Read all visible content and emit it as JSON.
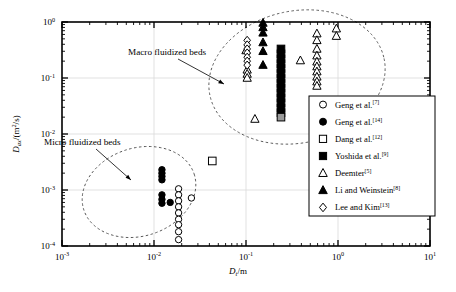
{
  "figure": {
    "background": "#ffffff",
    "frame_color": "#000000",
    "grid_color": "#d9d9d9",
    "guide_color": "#555555"
  },
  "axes": {
    "x": {
      "title_symbol": "D",
      "title_sub": "t",
      "title_unit": "/m",
      "ticks": [
        {
          "value": -3,
          "mantissa": "10",
          "exponent": "-3"
        },
        {
          "value": -2,
          "mantissa": "10",
          "exponent": "-2"
        },
        {
          "value": -1,
          "mantissa": "10",
          "exponent": "-1"
        },
        {
          "value": 0,
          "mantissa": "10",
          "exponent": "0"
        },
        {
          "value": 1,
          "mantissa": "10",
          "exponent": "1"
        }
      ],
      "min": -3,
      "max": 1,
      "scale": "log"
    },
    "y": {
      "title_symbol": "D",
      "title_sub": "ax",
      "title_unit": "/(m2/s)",
      "ticks": [
        {
          "value": -4,
          "mantissa": "10",
          "exponent": "-4"
        },
        {
          "value": -3,
          "mantissa": "10",
          "exponent": "-3"
        },
        {
          "value": -2,
          "mantissa": "10",
          "exponent": "-2"
        },
        {
          "value": -1,
          "mantissa": "10",
          "exponent": "-1"
        },
        {
          "value": 0,
          "mantissa": "10",
          "exponent": "0"
        }
      ],
      "min": -4,
      "max": 0,
      "scale": "log"
    }
  },
  "annotations": [
    {
      "id": "macro-label",
      "text": "Macro fluidized beds",
      "x": 128,
      "y": 55,
      "leader_from": [
        178,
        59
      ],
      "leader_to": [
        224,
        84
      ]
    },
    {
      "id": "micro-label",
      "text": "Micro fluidized beds",
      "x": 44,
      "y": 145,
      "leader_from": [
        96,
        149
      ],
      "leader_to": [
        131,
        180
      ]
    }
  ],
  "legend": {
    "box": {
      "x": 309,
      "y": 96,
      "width": 126,
      "height": 120
    },
    "entries": [
      {
        "marker": "open-circle",
        "label": "Geng et al.",
        "ref": "[7]"
      },
      {
        "marker": "filled-circle",
        "label": "Geng et al.",
        "ref": "[14]"
      },
      {
        "marker": "open-square",
        "label": "Dang et al.",
        "ref": "[12]"
      },
      {
        "marker": "filled-square",
        "label": "Yoshida et al.",
        "ref": "[9]"
      },
      {
        "marker": "open-triangle",
        "label": "Deemter",
        "ref": "[5]"
      },
      {
        "marker": "filled-triangle",
        "label": "Li and Weinstein",
        "ref": "[8]"
      },
      {
        "marker": "open-diamond",
        "label": "Lee and Kim",
        "ref": "[13]"
      }
    ]
  },
  "chart_data": {
    "type": "scatter",
    "title": "",
    "xlabel": "Dt/m",
    "ylabel": "Dax/(m2/s)",
    "xscale": "log",
    "yscale": "log",
    "xlim": [
      0.001,
      10
    ],
    "ylim": [
      0.0001,
      1
    ],
    "grid": true,
    "groups": [
      {
        "name": "Micro fluidized beds",
        "region": "ellipse",
        "center_x": 0.016,
        "center_y": 0.0012
      },
      {
        "name": "Macro fluidized beds",
        "region": "ellipse",
        "center_x": 0.35,
        "center_y": 0.18
      }
    ],
    "series": [
      {
        "name": "Geng et al.[7]",
        "marker": "open-circle",
        "points": [
          [
            0.0185,
            0.00105
          ],
          [
            0.0185,
            0.00082
          ],
          [
            0.0185,
            0.00064
          ],
          [
            0.0185,
            0.0005
          ],
          [
            0.0185,
            0.00039
          ],
          [
            0.0185,
            0.0003
          ],
          [
            0.0185,
            0.00024
          ],
          [
            0.0185,
            0.00018
          ],
          [
            0.0185,
            0.00013
          ],
          [
            0.0255,
            0.00072
          ]
        ]
      },
      {
        "name": "Geng et al.[14]",
        "marker": "filled-circle",
        "points": [
          [
            0.0122,
            0.0023
          ],
          [
            0.0122,
            0.002
          ],
          [
            0.0122,
            0.00175
          ],
          [
            0.0122,
            0.00152
          ],
          [
            0.0122,
            0.00082
          ],
          [
            0.0122,
            0.00068
          ],
          [
            0.0122,
            0.00058
          ],
          [
            0.015,
            0.0006
          ]
        ]
      },
      {
        "name": "Dang et al.[12]",
        "marker": "open-square",
        "points": [
          [
            0.043,
            0.0033
          ]
        ]
      },
      {
        "name": "Yoshida et al.[9]",
        "marker": "filled-square",
        "points": [
          [
            0.24,
            0.33
          ],
          [
            0.24,
            0.27
          ],
          [
            0.24,
            0.22
          ],
          [
            0.24,
            0.18
          ],
          [
            0.24,
            0.148
          ],
          [
            0.24,
            0.12
          ],
          [
            0.24,
            0.098
          ],
          [
            0.24,
            0.08
          ],
          [
            0.24,
            0.066
          ],
          [
            0.24,
            0.054
          ],
          [
            0.24,
            0.044
          ],
          [
            0.24,
            0.036
          ],
          [
            0.24,
            0.029
          ],
          [
            0.24,
            0.024
          ]
        ],
        "gray_point": [
          0.24,
          0.02
        ]
      },
      {
        "name": "Deemter[5]",
        "marker": "open-triangle",
        "points": [
          [
            0.1,
            0.31
          ],
          [
            0.103,
            0.14
          ],
          [
            0.103,
            0.118
          ],
          [
            0.103,
            0.1
          ],
          [
            0.125,
            0.0185
          ],
          [
            0.39,
            0.205
          ],
          [
            0.59,
            0.62
          ],
          [
            0.59,
            0.47
          ],
          [
            0.59,
            0.33
          ],
          [
            0.59,
            0.25
          ],
          [
            0.59,
            0.195
          ],
          [
            0.59,
            0.16
          ],
          [
            0.59,
            0.13
          ],
          [
            0.59,
            0.105
          ],
          [
            0.59,
            0.086
          ],
          [
            0.59,
            0.072
          ],
          [
            0.96,
            0.76
          ],
          [
            0.96,
            0.56
          ]
        ]
      },
      {
        "name": "Li and Weinstein[8]",
        "marker": "filled-triangle",
        "points": [
          [
            0.153,
            0.96
          ],
          [
            0.153,
            0.8
          ],
          [
            0.153,
            0.64
          ],
          [
            0.153,
            0.43
          ],
          [
            0.153,
            0.3
          ],
          [
            0.153,
            0.17
          ]
        ]
      },
      {
        "name": "Lee and Kim[13]",
        "marker": "open-diamond",
        "points": [
          [
            0.103,
            0.47
          ],
          [
            0.103,
            0.39
          ],
          [
            0.103,
            0.33
          ],
          [
            0.103,
            0.28
          ],
          [
            0.103,
            0.235
          ],
          [
            0.103,
            0.2
          ],
          [
            0.103,
            0.17
          ]
        ]
      }
    ]
  }
}
